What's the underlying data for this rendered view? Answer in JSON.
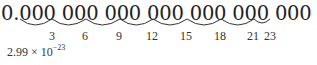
{
  "number": {
    "text": "0.000 000 000 000 000 000 000 02,9 9 g"
  },
  "arcs": {
    "labels": [
      "3",
      "6",
      "9",
      "12",
      "15",
      "18",
      "21",
      "23"
    ]
  },
  "scientific": {
    "mantissa": "2.99 × 10",
    "exponent": "−23"
  }
}
